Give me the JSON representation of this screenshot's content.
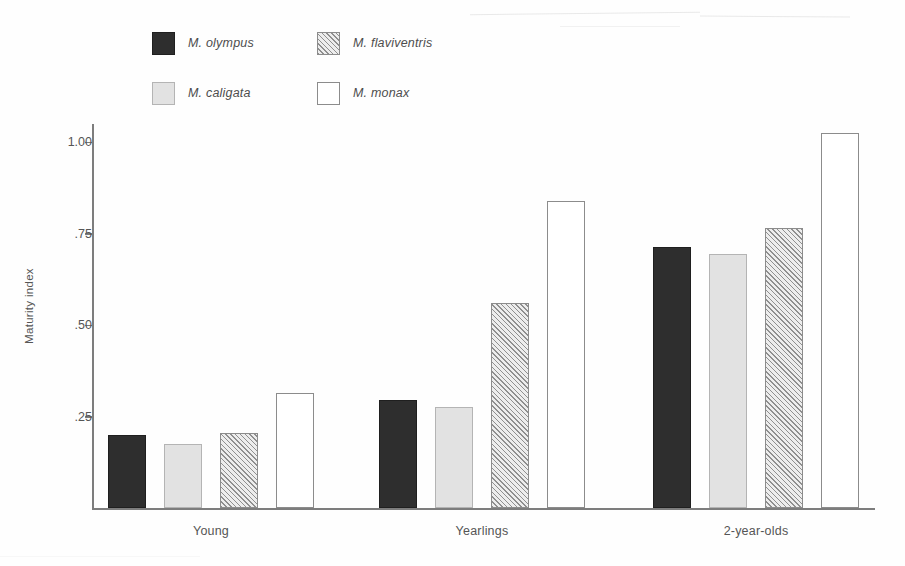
{
  "figure": {
    "type": "grouped-bar-chart",
    "background": "#ffffff"
  },
  "legend": {
    "position": "top-left",
    "entries": [
      {
        "label": "M. olympus",
        "pattern": "solid-dark",
        "color": "#2e2e2e"
      },
      {
        "label": "M. flaviventris",
        "pattern": "diagonal-hatch",
        "color": "#8f8f8f"
      },
      {
        "label": "M. caligata",
        "pattern": "solid-light",
        "color": "#e2e2e2"
      },
      {
        "label": "M. monax",
        "pattern": "open-white",
        "color": "#ffffff"
      }
    ]
  },
  "axes": {
    "y_title": "Maturity index",
    "y_ticks": [
      "1.00",
      ".75",
      ".50",
      ".25"
    ],
    "y_tick_values": [
      1.0,
      0.75,
      0.5,
      0.25
    ],
    "x_categories": [
      "Young",
      "Yearlings",
      "2-year-olds"
    ]
  },
  "chart_data": {
    "type": "bar",
    "title": "",
    "xlabel": "",
    "ylabel": "Maturity index",
    "categories": [
      "Young",
      "Yearlings",
      "2-year-olds"
    ],
    "ylim": [
      0,
      1.05
    ],
    "yticks": [
      0.25,
      0.5,
      0.75,
      1.0
    ],
    "ytick_labels": [
      ".25",
      ".50",
      ".75",
      "1.00"
    ],
    "grid": false,
    "legend_position": "top-left",
    "series": [
      {
        "name": "M. olympus",
        "values": [
          0.2,
          0.295,
          0.715
        ],
        "color": "#2e2e2e",
        "pattern": "solid-dark"
      },
      {
        "name": "M. caligata",
        "values": [
          0.175,
          0.275,
          0.695
        ],
        "color": "#e2e2e2",
        "pattern": "solid-light"
      },
      {
        "name": "M. flaviventris",
        "values": [
          0.205,
          0.56,
          0.765
        ],
        "color": "#8f8f8f",
        "pattern": "diagonal-hatch"
      },
      {
        "name": "M. monax",
        "values": [
          0.315,
          0.84,
          1.025
        ],
        "color": "#ffffff",
        "pattern": "open-white"
      }
    ]
  }
}
